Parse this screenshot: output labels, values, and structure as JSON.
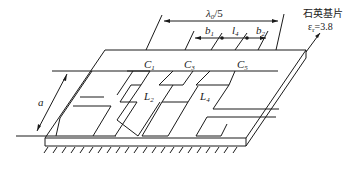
{
  "diagram": {
    "dimensions": {
      "period": "λ",
      "period_sub": "0",
      "period_suffix": "/5",
      "b1": "b",
      "b1_sub": "1",
      "l4": "l",
      "l4_sub": "4",
      "b2": "b",
      "b2_sub": "2",
      "a": "a"
    },
    "capacitors": [
      {
        "name": "C",
        "sub": "1"
      },
      {
        "name": "C",
        "sub": "3"
      },
      {
        "name": "C",
        "sub": "5"
      }
    ],
    "inductors": [
      {
        "name": "L",
        "sub": "2"
      },
      {
        "name": "L",
        "sub": "4"
      }
    ],
    "substrate": {
      "label": "石英基片",
      "permittivity_symbol": "ε",
      "permittivity_sub": "r",
      "permittivity_value": "=3.8"
    },
    "ground": "ground-plane-hatching"
  }
}
